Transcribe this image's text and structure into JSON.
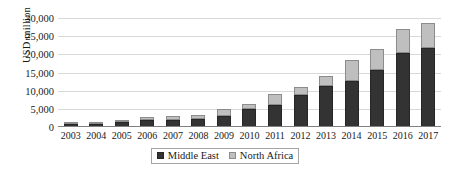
{
  "chart_data": {
    "type": "bar",
    "stacked": true,
    "title": "",
    "xlabel": "",
    "ylabel": "USD million",
    "ylim": [
      0,
      30000
    ],
    "yticks": [
      "30,000",
      "25,000",
      "20,000",
      "15,000",
      "10,000",
      "5,000",
      "0"
    ],
    "ytick_values": [
      30000,
      25000,
      20000,
      15000,
      10000,
      5000,
      0
    ],
    "grid": true,
    "legend_position": "bottom",
    "categories": [
      "2003",
      "2004",
      "2005",
      "2006",
      "2007",
      "2008",
      "2009",
      "2010",
      "2011",
      "2012",
      "2013",
      "2014",
      "2015",
      "2016",
      "2017"
    ],
    "series": [
      {
        "name": "Middle East",
        "color": "#333333",
        "values": [
          700,
          800,
          1400,
          1800,
          2000,
          2100,
          3000,
          5000,
          6100,
          8700,
          11300,
          12700,
          15600,
          20400,
          21700
        ]
      },
      {
        "name": "North Africa",
        "color": "#bfbfbf",
        "values": [
          100,
          150,
          400,
          900,
          1100,
          1300,
          1900,
          1400,
          3000,
          2300,
          2700,
          5700,
          5900,
          6600,
          6900
        ]
      }
    ],
    "totals": [
      800,
      950,
      1800,
      2700,
      3100,
      3400,
      4900,
      6400,
      9100,
      11000,
      14000,
      18400,
      21500,
      27000,
      28600
    ]
  },
  "legend": {
    "items": [
      {
        "label": "Middle East",
        "color": "#333333"
      },
      {
        "label": "North Africa",
        "color": "#bfbfbf"
      }
    ]
  }
}
